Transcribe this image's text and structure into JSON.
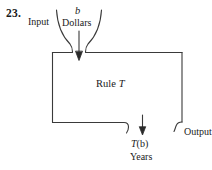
{
  "figure": {
    "problem_number": "23.",
    "type": "function-machine-diagram",
    "stroke_color": "#3a3a3a",
    "background_color": "#ffffff",
    "text_color": "#1a1a1a"
  },
  "labels": {
    "input": "Input",
    "variable_b": "b",
    "units_in": "Dollars",
    "rule_word": "Rule",
    "rule_name": "T",
    "output_expression_prefix": "T",
    "output_expression_arg": "(b)",
    "output_expression": "T(b)",
    "units_out": "Years",
    "output": "Output"
  }
}
